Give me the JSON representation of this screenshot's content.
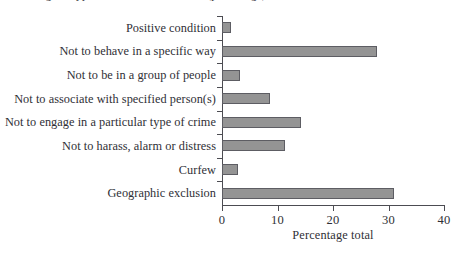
{
  "figure": {
    "clipped_title": "Figure: types of conditions attached (percentage)",
    "background_color": "#ffffff"
  },
  "chart_data": {
    "type": "bar",
    "orientation": "horizontal",
    "title": "",
    "xlabel": "Percentage total",
    "ylabel": "",
    "xlim": [
      0,
      40
    ],
    "xticks": [
      0,
      10,
      20,
      30,
      40
    ],
    "xticklabels": [
      "0",
      "10",
      "20",
      "30",
      "40"
    ],
    "grid": false,
    "legend": false,
    "bar_color": "#949494",
    "bar_edge_color": "#5d5d63",
    "axis_color": "#4c4c52",
    "text_color": "#2f2f36",
    "categories": [
      "Positive condition",
      "Not to behave in a specific way",
      "Not to be in a group of people",
      "Not to associate with specified person(s)",
      "Not to engage in a particular type of crime",
      "Not to harass, alarm or distress",
      "Curfew",
      "Geographic exclusion"
    ],
    "values": [
      1.6,
      28.0,
      3.2,
      8.7,
      14.2,
      11.3,
      2.8,
      31.0
    ]
  }
}
